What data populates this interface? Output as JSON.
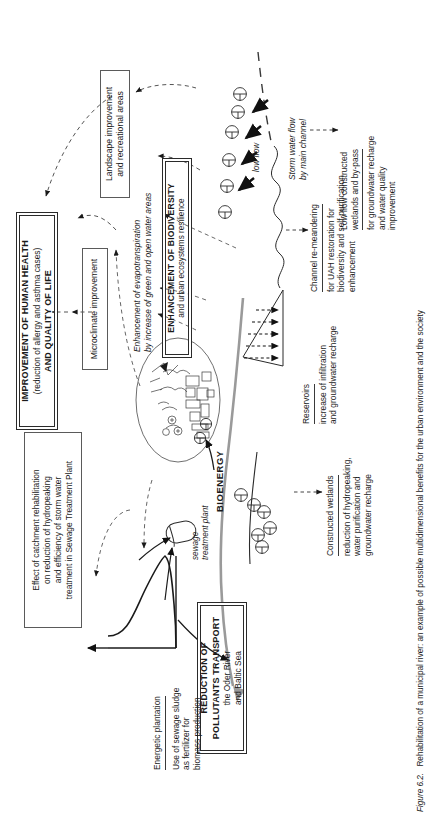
{
  "figure": {
    "number": "Figure 6.2.",
    "caption": "Rehabilitation of a municipal river: an example of possible multidimensional benefits for the urban environment and the society"
  },
  "boxes": {
    "human_health": {
      "line1": "IMPROVEMENT OF HUMAN HEALTH",
      "line2": "(reduction of allergy and asthma cases)",
      "line3": "AND QUALITY OF LIFE"
    },
    "microclimate": {
      "line1": "Microclimate improvement"
    },
    "landscape": {
      "line1": "Landscape improvement",
      "line2": "and recreational areas"
    },
    "biodiversity": {
      "line1": "ENHANCEMENT OF BIODIVERSITY",
      "line2": "and urban ecosystems resilience"
    },
    "catchment": {
      "line1": "Effect of catchment rehabilitation",
      "line2": "on reduction of hydropeaking",
      "line3": "and efficiency of storm water",
      "line4": "treatment in Sewage Treatment Plant"
    },
    "pollutants": {
      "line1": "REDUCTION OF",
      "line2": "POLLUTANTS TRANSPORT",
      "line3": "the Oder River",
      "line4": "and Baltic Sea"
    }
  },
  "labels": {
    "evapotranspiration": {
      "line1": "Enhancement of evapotranspiration",
      "line2": "by increase of green and open water areas"
    },
    "low_flow": "low flow",
    "storm_water": {
      "line1": "Storm water flow",
      "line2": "by main channel"
    },
    "low_flow_wetlands": {
      "title1": "Low flow constructed",
      "title2": "wetlands and by-pass",
      "body1": "for groundwater recharge",
      "body2": "and water quality improvement"
    },
    "channel_remeandering": {
      "title": "Channel re-meandering",
      "body1": "for UAH restoration for",
      "body2": "biodiversity and self-purification",
      "body3": "enhancement"
    },
    "reservoirs": {
      "title": "Reservoirs",
      "body1": "increase of infiltration",
      "body2": "and groundwater recharge"
    },
    "constructed_wetlands": {
      "title": "Constructed wetlands",
      "body1": "reduction of hydropeaking,",
      "body2": "water purification and",
      "body3": "groundwater recharge"
    },
    "energetic_plantation": {
      "title": "Energetic plantation",
      "body1": "Use of sewage sludge",
      "body2": "as fertilizer for",
      "body3": "biomass production"
    },
    "sewage_treatment_plant": {
      "line1": "sewage",
      "line2": "treatment plant"
    },
    "bioenergy": "BIOENERGY"
  },
  "colors": {
    "ink": "#1a1a1a",
    "line": "#3a3a3a",
    "box_border": "#5a5a5a",
    "river": "#8a8a8a",
    "dashed": "#444444"
  }
}
